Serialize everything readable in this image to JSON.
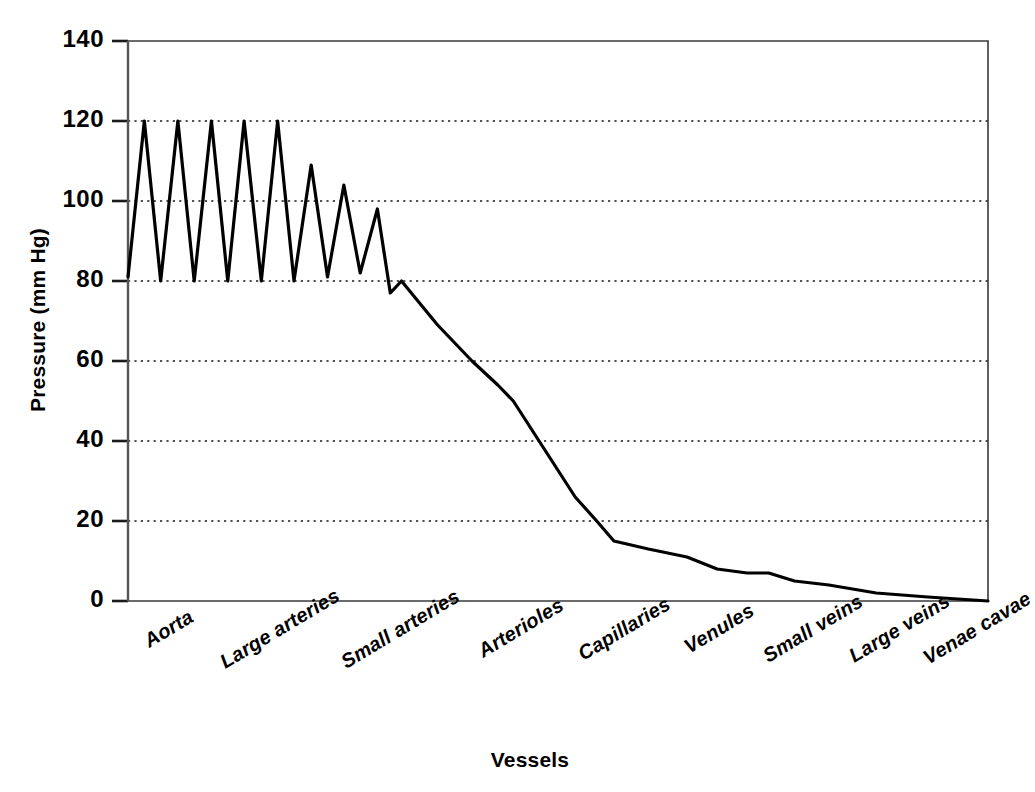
{
  "chart_data": {
    "type": "line",
    "title": "",
    "subtitle": "",
    "xlabel": "Vessels",
    "ylabel": "Pressure (mm Hg)",
    "ylim": [
      0,
      140
    ],
    "yticks": [
      0,
      20,
      40,
      60,
      80,
      100,
      120,
      140
    ],
    "ytick_labels": [
      "0",
      "20",
      "40",
      "60",
      "80",
      "100",
      "120",
      "140"
    ],
    "grid": "horizontal-dotted",
    "legend": "none",
    "categories": [
      "Aorta",
      "Large arteries",
      "Small arteries",
      "Arterioles",
      "Capillaries",
      "Venules",
      "Small veins",
      "Large veins",
      "Venae cavae"
    ],
    "category_x_positions": [
      0.04,
      0.17,
      0.31,
      0.45,
      0.57,
      0.68,
      0.79,
      0.89,
      0.98
    ],
    "annotations": [
      "Pulsatile systolic/diastolic oscillation 120/80 mm Hg in aorta and large arteries",
      "Oscillation damps out across small arteries",
      "Steep pressure drop across arterioles and capillaries",
      "Pressure approaches 0 mm Hg at the venae cavae"
    ],
    "series": [
      {
        "name": "Blood pressure",
        "color": "#000000",
        "line_width": 3.2,
        "points": [
          {
            "x": 0.0,
            "y": 81
          },
          {
            "x": 0.019,
            "y": 120
          },
          {
            "x": 0.038,
            "y": 80
          },
          {
            "x": 0.058,
            "y": 120
          },
          {
            "x": 0.077,
            "y": 80
          },
          {
            "x": 0.097,
            "y": 120
          },
          {
            "x": 0.116,
            "y": 80
          },
          {
            "x": 0.135,
            "y": 120
          },
          {
            "x": 0.155,
            "y": 80
          },
          {
            "x": 0.174,
            "y": 120
          },
          {
            "x": 0.193,
            "y": 80
          },
          {
            "x": 0.213,
            "y": 109
          },
          {
            "x": 0.232,
            "y": 81
          },
          {
            "x": 0.251,
            "y": 104
          },
          {
            "x": 0.27,
            "y": 82
          },
          {
            "x": 0.29,
            "y": 98
          },
          {
            "x": 0.305,
            "y": 77
          },
          {
            "x": 0.318,
            "y": 80
          },
          {
            "x": 0.36,
            "y": 69
          },
          {
            "x": 0.4,
            "y": 60
          },
          {
            "x": 0.43,
            "y": 54
          },
          {
            "x": 0.448,
            "y": 50
          },
          {
            "x": 0.478,
            "y": 40
          },
          {
            "x": 0.52,
            "y": 26
          },
          {
            "x": 0.545,
            "y": 20
          },
          {
            "x": 0.565,
            "y": 15
          },
          {
            "x": 0.605,
            "y": 13
          },
          {
            "x": 0.65,
            "y": 11
          },
          {
            "x": 0.685,
            "y": 8
          },
          {
            "x": 0.72,
            "y": 7
          },
          {
            "x": 0.745,
            "y": 7
          },
          {
            "x": 0.775,
            "y": 5
          },
          {
            "x": 0.815,
            "y": 4
          },
          {
            "x": 0.87,
            "y": 2
          },
          {
            "x": 0.93,
            "y": 1
          },
          {
            "x": 1.0,
            "y": 0
          }
        ]
      }
    ]
  },
  "axes": {
    "y_title": "Pressure (mm Hg)",
    "x_title": "Vessels"
  }
}
